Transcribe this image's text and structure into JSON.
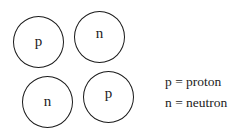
{
  "diagram": {
    "particles": [
      {
        "label": "p",
        "type": "proton"
      },
      {
        "label": "n",
        "type": "neutron"
      },
      {
        "label": "n",
        "type": "neutron"
      },
      {
        "label": "p",
        "type": "proton"
      }
    ],
    "legend": [
      {
        "text": "p = proton"
      },
      {
        "text": "n = neutron"
      }
    ]
  }
}
